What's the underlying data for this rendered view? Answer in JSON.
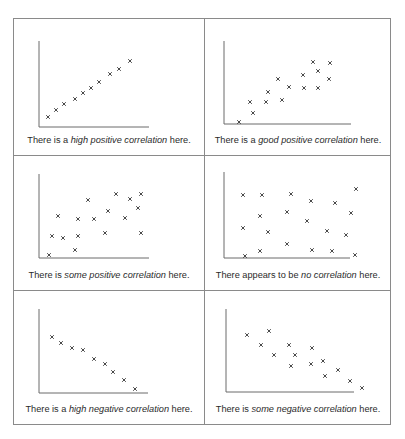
{
  "panels": [
    {
      "id": "high-positive",
      "caption": {
        "before": "There is a ",
        "emph": "high positive correlation",
        "after": " here."
      },
      "points": [
        [
          34,
          98
        ],
        [
          42,
          91
        ],
        [
          50,
          85
        ],
        [
          61,
          80
        ],
        [
          69,
          74
        ],
        [
          77,
          69
        ],
        [
          85,
          63
        ],
        [
          96,
          55
        ],
        [
          105,
          50
        ],
        [
          116,
          42
        ]
      ]
    },
    {
      "id": "good-positive",
      "caption": {
        "before": "There is a ",
        "emph": "good positive correlation",
        "after": " here."
      },
      "points": [
        [
          35,
          103
        ],
        [
          49,
          94
        ],
        [
          46,
          83
        ],
        [
          62,
          83
        ],
        [
          78,
          81
        ],
        [
          64,
          73
        ],
        [
          74,
          60
        ],
        [
          85,
          68
        ],
        [
          99,
          56
        ],
        [
          100,
          69
        ],
        [
          114,
          69
        ],
        [
          109,
          43
        ],
        [
          114,
          52
        ],
        [
          125,
          60
        ],
        [
          126,
          44
        ]
      ]
    },
    {
      "id": "some-positive",
      "caption": {
        "before": "There is ",
        "emph": "some positive correlation",
        "after": " here."
      },
      "points": [
        [
          35,
          99
        ],
        [
          38,
          80
        ],
        [
          44,
          60
        ],
        [
          49,
          82
        ],
        [
          61,
          94
        ],
        [
          64,
          63
        ],
        [
          64,
          80
        ],
        [
          74,
          44
        ],
        [
          80,
          63
        ],
        [
          91,
          77
        ],
        [
          94,
          55
        ],
        [
          102,
          38
        ],
        [
          111,
          62
        ],
        [
          116,
          43
        ],
        [
          124,
          52
        ],
        [
          127,
          38
        ],
        [
          127,
          77
        ]
      ]
    },
    {
      "id": "no-correlation",
      "caption": {
        "before": "There appears to be ",
        "emph": "no correlation",
        "after": " here."
      },
      "points": [
        [
          39,
          39
        ],
        [
          58,
          39
        ],
        [
          87,
          38
        ],
        [
          107,
          45
        ],
        [
          131,
          47
        ],
        [
          152,
          33
        ],
        [
          56,
          60
        ],
        [
          83,
          56
        ],
        [
          103,
          65
        ],
        [
          147,
          57
        ],
        [
          39,
          72
        ],
        [
          64,
          76
        ],
        [
          123,
          75
        ],
        [
          142,
          79
        ],
        [
          83,
          88
        ],
        [
          41,
          100
        ],
        [
          56,
          95
        ],
        [
          108,
          94
        ],
        [
          128,
          95
        ],
        [
          151,
          99
        ]
      ]
    },
    {
      "id": "high-negative",
      "caption": {
        "before": "There is a ",
        "emph": "high negative correlation",
        "after": " here."
      },
      "points": [
        [
          38,
          46
        ],
        [
          47,
          52
        ],
        [
          58,
          57
        ],
        [
          69,
          59
        ],
        [
          80,
          68
        ],
        [
          91,
          73
        ],
        [
          99,
          81
        ],
        [
          110,
          89
        ],
        [
          121,
          98
        ]
      ]
    },
    {
      "id": "some-negative",
      "caption": {
        "before": "There is ",
        "emph": "some negative correlation",
        "after": " here."
      },
      "points": [
        [
          43,
          44
        ],
        [
          65,
          40
        ],
        [
          57,
          54
        ],
        [
          85,
          54
        ],
        [
          70,
          64
        ],
        [
          91,
          64
        ],
        [
          108,
          57
        ],
        [
          87,
          75
        ],
        [
          107,
          73
        ],
        [
          119,
          70
        ],
        [
          121,
          85
        ],
        [
          134,
          79
        ],
        [
          146,
          90
        ],
        [
          158,
          97
        ]
      ]
    }
  ],
  "style": {
    "border_color": "#8a8a8a",
    "axis_color": "#6a6a6a",
    "marker_color": "#333333",
    "marker": "x"
  }
}
